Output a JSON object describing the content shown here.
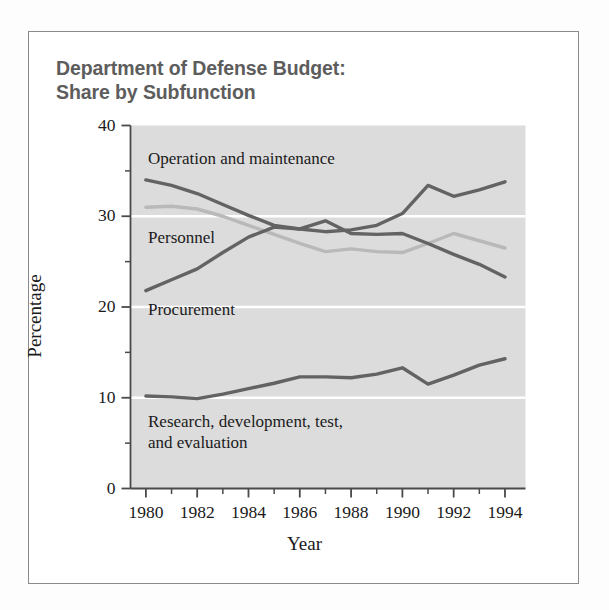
{
  "figure": {
    "title": "Department of Defense Budget:\nShare by Subfunction",
    "frame_color": "#8a8a8a",
    "plot_background": "#dcdcdc",
    "gridline_color": "#ffffff"
  },
  "axes": {
    "y_title": "Percentage",
    "x_title": "Year",
    "y_ticks": [
      "0",
      "10",
      "20",
      "30",
      "40"
    ],
    "x_ticks": [
      "1980",
      "1982",
      "1984",
      "1986",
      "1988",
      "1990",
      "1992",
      "1994"
    ]
  },
  "series_labels": {
    "operation": "Operation and maintenance",
    "personnel": "Personnel",
    "procurement": "Procurement",
    "rdte": "Research, development, test,\nand evaluation"
  },
  "chart_data": {
    "type": "line",
    "title": "Department of Defense Budget: Share by Subfunction",
    "xlabel": "Year",
    "ylabel": "Percentage",
    "xlim": [
      1979.4,
      1994.8
    ],
    "ylim": [
      0,
      40
    ],
    "ytick_values": [
      0,
      10,
      20,
      30,
      40
    ],
    "yminor_step": 5,
    "xtick_values": [
      1980,
      1982,
      1984,
      1986,
      1988,
      1990,
      1992,
      1994
    ],
    "xminor_step": 1,
    "grid": "horizontal-white-at-10-20-30",
    "legend": "inline-annotations",
    "x": [
      1980,
      1981,
      1982,
      1983,
      1984,
      1985,
      1986,
      1987,
      1988,
      1989,
      1990,
      1991,
      1992,
      1993,
      1994
    ],
    "series": [
      {
        "name": "Operation and maintenance",
        "color": "#636363",
        "values": [
          34.0,
          33.4,
          32.5,
          31.3,
          30.1,
          29.0,
          28.6,
          28.3,
          28.5,
          29.0,
          30.3,
          33.4,
          32.2,
          32.9,
          33.8
        ]
      },
      {
        "name": "Personnel",
        "color": "#b9b9b9",
        "values": [
          31.0,
          31.1,
          30.8,
          30.0,
          29.0,
          28.0,
          27.0,
          26.1,
          26.4,
          26.1,
          26.0,
          27.0,
          28.1,
          27.3,
          26.5
        ]
      },
      {
        "name": "Procurement",
        "color": "#636363",
        "values": [
          21.8,
          23.0,
          24.2,
          26.0,
          27.7,
          28.8,
          28.6,
          29.5,
          28.1,
          28.0,
          28.1,
          27.0,
          25.8,
          24.7,
          23.3
        ]
      },
      {
        "name": "Research, development, test, and evaluation",
        "color": "#636363",
        "values": [
          10.2,
          10.1,
          9.9,
          10.4,
          11.0,
          11.6,
          12.3,
          12.3,
          12.2,
          12.6,
          13.3,
          11.5,
          12.5,
          13.6,
          14.3
        ]
      }
    ]
  }
}
